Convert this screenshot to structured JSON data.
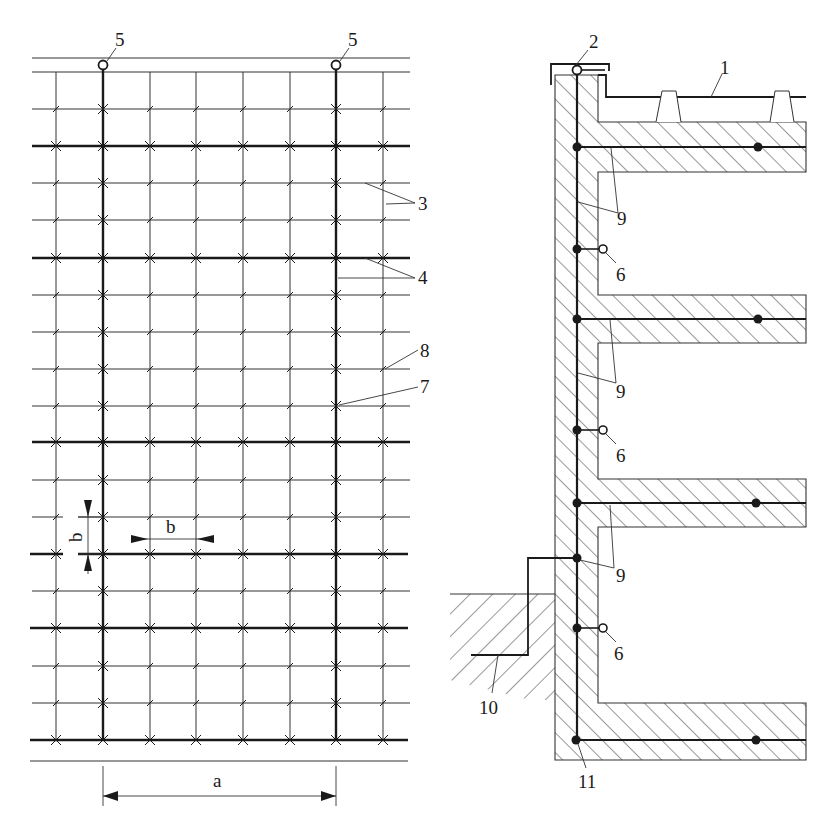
{
  "figure": {
    "plan_view": {
      "labels": {
        "air_terminal_left": "5",
        "air_terminal_right": "5",
        "grid_lines": "3",
        "main_conductors": "4",
        "crossing_point_minor": "8",
        "crossing_point_major": "7",
        "mesh_spacing_vertical": "b",
        "mesh_spacing_horizontal": "b",
        "downconductor_spacing": "a"
      }
    },
    "section_view": {
      "labels": {
        "roof_covering": "1",
        "parapet_terminal": "2",
        "connection_point_1": "6",
        "connection_point_2": "6",
        "connection_point_3": "6",
        "reinforcement_1": "9",
        "reinforcement_2": "9",
        "reinforcement_3": "9",
        "earth_conductor": "10",
        "foundation_earth": "11"
      }
    },
    "colors": {
      "line": "#1a1a1a",
      "thin_line": "#333333",
      "background": "#ffffff"
    }
  }
}
